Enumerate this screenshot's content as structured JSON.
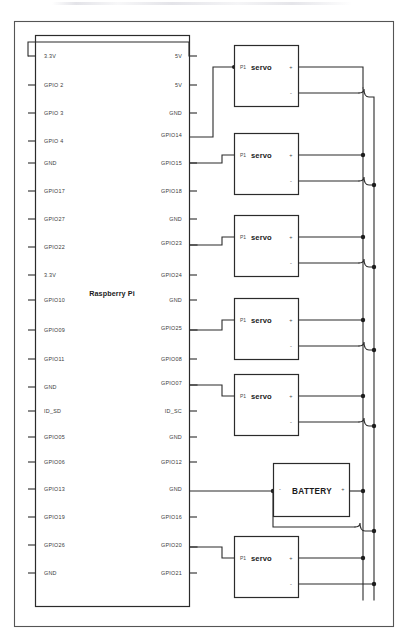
{
  "diagram": {
    "chip_name": "Raspberry Pi",
    "battery_label": "BATTERY",
    "servo_label": "servo",
    "servo_ref": "P1",
    "plus_symbol": "+",
    "minus_symbol": "-",
    "colors": {
      "wire": "#2b2b2b",
      "box_stroke": "#2b2b2b",
      "frame": "#555555",
      "text": "#3a3a3a",
      "background": "#ffffff"
    }
  },
  "chip": {
    "name": "Raspberry Pi",
    "left_pins": [
      {
        "label": "3.3V"
      },
      {
        "label": "GPIO 2"
      },
      {
        "label": "GPIO 3"
      },
      {
        "label": "GPIO 4"
      },
      {
        "label": "GND"
      },
      {
        "label": "GPIO17"
      },
      {
        "label": "GPIO27"
      },
      {
        "label": "GPIO22"
      },
      {
        "label": "3.3V"
      },
      {
        "label": "GPIO10"
      },
      {
        "label": "GPIO09"
      },
      {
        "label": "GPIO11"
      },
      {
        "label": "GND"
      },
      {
        "label": "ID_SD"
      },
      {
        "label": "GPIO05"
      },
      {
        "label": "GPIO06"
      },
      {
        "label": "GPIO13"
      },
      {
        "label": "GPIO19"
      },
      {
        "label": "GPIO26"
      },
      {
        "label": "GND"
      }
    ],
    "right_pins": [
      {
        "label": "5V"
      },
      {
        "label": "5V"
      },
      {
        "label": "GND"
      },
      {
        "label": "GPIO14"
      },
      {
        "label": "GPIO15"
      },
      {
        "label": "GPIO18"
      },
      {
        "label": "GND"
      },
      {
        "label": "GPIO23"
      },
      {
        "label": "GPIO24"
      },
      {
        "label": "GND"
      },
      {
        "label": "GPIO25"
      },
      {
        "label": "GPIO08"
      },
      {
        "label": "GPIO07"
      },
      {
        "label": "ID_SC"
      },
      {
        "label": "GND"
      },
      {
        "label": "GPIO12"
      },
      {
        "label": "GND"
      },
      {
        "label": "GPIO16"
      },
      {
        "label": "GPIO20"
      },
      {
        "label": "GPIO21"
      }
    ]
  },
  "servos": [
    {
      "ref": "P1",
      "label": "servo",
      "signal_pin": "GPIO14"
    },
    {
      "ref": "P1",
      "label": "servo",
      "signal_pin": "GPIO15"
    },
    {
      "ref": "P1",
      "label": "servo",
      "signal_pin": "GPIO23"
    },
    {
      "ref": "P1",
      "label": "servo",
      "signal_pin": "GPIO25"
    },
    {
      "ref": "P1",
      "label": "servo",
      "signal_pin": "GPIO07"
    },
    {
      "ref": "P1",
      "label": "servo",
      "signal_pin": "GPIO20"
    }
  ],
  "battery": {
    "label": "BATTERY",
    "negative_terminal": "-",
    "positive_terminal": "+",
    "negative_source_pin": "GND"
  }
}
